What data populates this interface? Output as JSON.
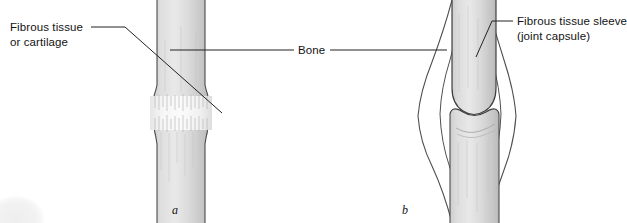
{
  "figure": {
    "type": "anatomical-diagram",
    "background_color": "#ffffff",
    "ink_color": "#1a1a1a",
    "bone_fill_color": "#d9d9d9",
    "bone_shade_color": "#bfbfbf",
    "cartilage_color": "#f2f2f2"
  },
  "labels": {
    "fibrous_cartilage": {
      "line1": "Fibrous tissue",
      "line2": "or cartilage"
    },
    "bone": "Bone",
    "fibrous_sleeve": {
      "line1": "Fibrous tissue sleeve",
      "line2": "(joint capsule)"
    }
  },
  "panels": [
    {
      "letter": "a",
      "name": "fibrous-or-cartilaginous-joint",
      "description": "Two bone shafts united by a band of fibrous tissue or cartilage"
    },
    {
      "letter": "b",
      "name": "synovial-joint",
      "description": "Two bone ends enclosed by a fibrous tissue sleeve (joint capsule)"
    }
  ],
  "leader_lines": [
    {
      "name": "fibrous-cartilage-leader",
      "from_label": "Fibrous tissue or cartilage",
      "points": "91,27 125,27 222,113"
    },
    {
      "name": "bone-leader-left",
      "from_label": "Bone",
      "points": "170,50 294,50"
    },
    {
      "name": "bone-leader-right",
      "from_label": "Bone",
      "points": "330,50 447,50"
    },
    {
      "name": "fibrous-sleeve-leader",
      "from_label": "Fibrous tissue sleeve (joint capsule)",
      "points": "513,21 492,21 476,57"
    }
  ],
  "watermark": {
    "name": "corner-watermark",
    "shape": "circle",
    "color": "#f0f0f0"
  }
}
